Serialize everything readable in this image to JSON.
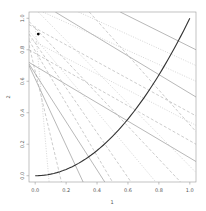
{
  "chart_data": {
    "type": "line",
    "title": "",
    "xlabel": "1",
    "ylabel": "2",
    "xlim": [
      -0.04,
      1.04
    ],
    "ylim": [
      -0.04,
      1.04
    ],
    "grid": false,
    "x_ticks": [
      "0.0",
      "0.2",
      "0.4",
      "0.6",
      "0.8",
      "1.0"
    ],
    "y_ticks": [
      "0.0",
      "0.2",
      "0.4",
      "0.6",
      "0.8",
      "1.0"
    ],
    "curve": {
      "name": "y = x^2",
      "x": [
        0,
        0.1,
        0.2,
        0.3,
        0.4,
        0.5,
        0.6,
        0.7,
        0.8,
        0.9,
        1.0
      ],
      "y": [
        0,
        0.01,
        0.04,
        0.09,
        0.16,
        0.25,
        0.36,
        0.49,
        0.64,
        0.81,
        1.0
      ],
      "color": "#333333"
    },
    "point": {
      "x": 0.02,
      "y": 0.9,
      "color": "#000000"
    },
    "lines": [
      {
        "style": "solid",
        "x0": -0.04,
        "y0": 0.7,
        "x1": 0.31,
        "y1": -0.04
      },
      {
        "style": "dashed",
        "x0": -0.04,
        "y0": 0.83,
        "x1": 0.17,
        "y1": -0.04
      },
      {
        "style": "dotted",
        "x0": 0.0,
        "y0": 0.95,
        "x1": 0.09,
        "y1": -0.04
      },
      {
        "style": "solid",
        "x0": -0.04,
        "y0": 0.72,
        "x1": 1.04,
        "y1": 0.09
      },
      {
        "style": "dashed",
        "x0": -0.04,
        "y0": 0.8,
        "x1": 1.04,
        "y1": 0.2
      },
      {
        "style": "dotted",
        "x0": -0.04,
        "y0": 0.87,
        "x1": 1.04,
        "y1": 0.32
      },
      {
        "style": "solid",
        "x0": 0.13,
        "y0": 1.04,
        "x1": 1.04,
        "y1": 0.5
      },
      {
        "style": "dashed",
        "x0": -0.04,
        "y0": 0.96,
        "x1": 1.04,
        "y1": 0.38
      },
      {
        "style": "dotted",
        "x0": 0.05,
        "y0": 1.04,
        "x1": 1.04,
        "y1": 0.6
      },
      {
        "style": "solid",
        "x0": 0.55,
        "y0": 1.04,
        "x1": 1.04,
        "y1": 0.8
      },
      {
        "style": "dashed",
        "x0": -0.04,
        "y0": 0.9,
        "x1": 0.62,
        "y1": -0.04
      },
      {
        "style": "dotted",
        "x0": -0.04,
        "y0": 0.92,
        "x1": 0.78,
        "y1": -0.04
      },
      {
        "style": "dashed",
        "x0": -0.04,
        "y0": 0.98,
        "x1": 0.94,
        "y1": -0.04
      },
      {
        "style": "dotted",
        "x0": 0.02,
        "y0": 1.04,
        "x1": 1.04,
        "y1": 0.02
      },
      {
        "style": "solid",
        "x0": -0.04,
        "y0": 0.71,
        "x1": 0.45,
        "y1": -0.04
      },
      {
        "style": "dashed",
        "x0": -0.04,
        "y0": 0.86,
        "x1": 0.5,
        "y1": -0.04
      },
      {
        "style": "dotted",
        "x0": 0.28,
        "y0": 1.04,
        "x1": 1.04,
        "y1": 0.7
      },
      {
        "style": "dashed",
        "x0": 0.35,
        "y0": 1.04,
        "x1": 1.04,
        "y1": 0.28
      }
    ]
  }
}
